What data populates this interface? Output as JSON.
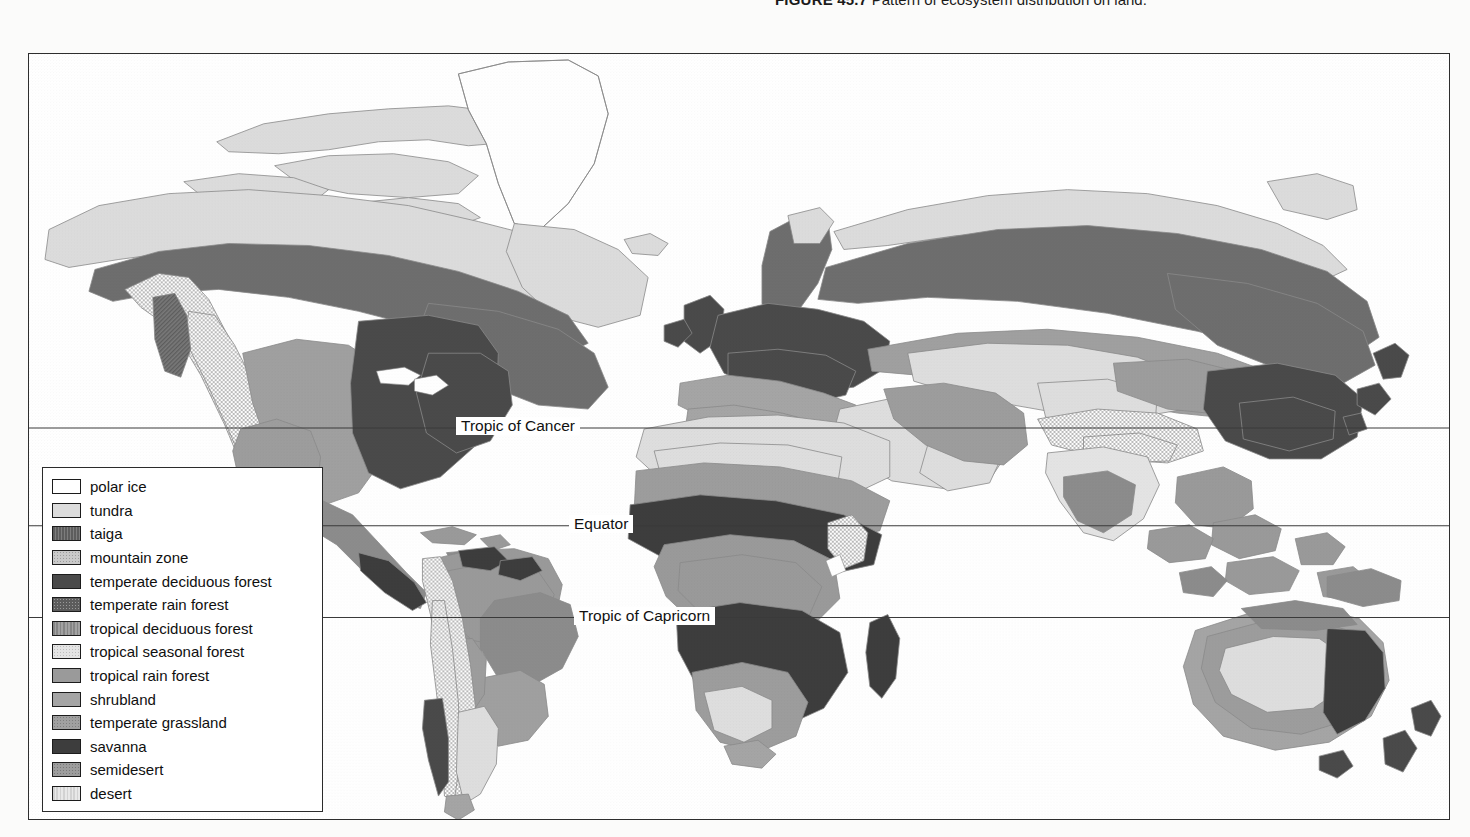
{
  "caption": {
    "figure_number": "FIGURE 45.7",
    "text": "Pattern of ecosystem distribution on land."
  },
  "map": {
    "latitude_lines": [
      {
        "label": "Tropic of Cancer",
        "y": 428,
        "label_x": 455
      },
      {
        "label": "Equator",
        "y": 526,
        "label_x": 568
      },
      {
        "label": "Tropic of Capricorn",
        "y": 618,
        "label_x": 573
      }
    ]
  },
  "legend": {
    "items": [
      {
        "label": "polar ice",
        "color": "#ffffff",
        "pattern": "solid"
      },
      {
        "label": "tundra",
        "color": "#dcdcdc",
        "pattern": "solid"
      },
      {
        "label": "taiga",
        "color": "#6e6e6e",
        "pattern": "hatch"
      },
      {
        "label": "mountain zone",
        "color": "#c9c9c9",
        "pattern": "stipple"
      },
      {
        "label": "temperate deciduous forest",
        "color": "#4a4a4a",
        "pattern": "solid"
      },
      {
        "label": "temperate rain forest",
        "color": "#5c5c5c",
        "pattern": "stipple"
      },
      {
        "label": "tropical deciduous forest",
        "color": "#8c8c8c",
        "pattern": "vline"
      },
      {
        "label": "tropical seasonal forest",
        "color": "#e4e4e4",
        "pattern": "stipple"
      },
      {
        "label": "tropical rain forest",
        "color": "#9a9a9a",
        "pattern": "solid"
      },
      {
        "label": "shrubland",
        "color": "#a5a5a5",
        "pattern": "solid"
      },
      {
        "label": "temperate grassland",
        "color": "#a0a0a0",
        "pattern": "stipple"
      },
      {
        "label": "savanna",
        "color": "#3d3d3d",
        "pattern": "solid"
      },
      {
        "label": "semidesert",
        "color": "#9d9d9d",
        "pattern": "stipple"
      },
      {
        "label": "desert",
        "color": "#dedede",
        "pattern": "vline"
      }
    ]
  },
  "colors": {
    "frame_border": "#2e2e2e",
    "ocean": "#ffffff",
    "coastline": "#8a8a8a",
    "lat_line": "#3a3a3a"
  }
}
